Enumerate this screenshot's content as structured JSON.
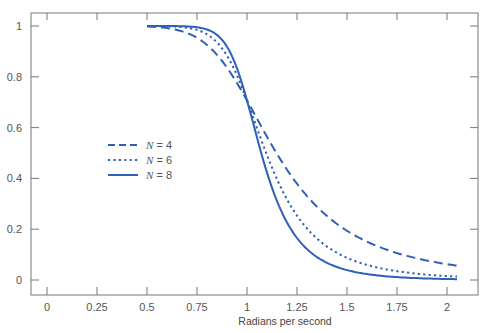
{
  "chart_data": {
    "type": "line",
    "title": "",
    "xlabel": "Radians per second",
    "ylabel": "",
    "xlim": [
      -0.07,
      2.15
    ],
    "ylim": [
      -0.06,
      1.05
    ],
    "xticks": [
      0,
      0.25,
      0.5,
      0.75,
      1,
      1.25,
      1.5,
      1.75,
      2
    ],
    "xtick_labels": [
      "0",
      "0.25",
      "0.5",
      "0.75",
      "1",
      "1.25",
      "1.5",
      "1.75",
      "2"
    ],
    "yticks": [
      0,
      0.2,
      0.4,
      0.6,
      0.8,
      1
    ],
    "ytick_labels": [
      "0",
      "0.2",
      "0.4",
      "0.6",
      "0.8",
      "1"
    ],
    "grid": false,
    "legend_position": "center-left",
    "line_color": "#2f5fb8",
    "series": [
      {
        "name": "N = 4",
        "style": "dashed",
        "order": 4
      },
      {
        "name": "N = 6",
        "style": "dotted",
        "order": 6
      },
      {
        "name": "N = 8",
        "style": "solid",
        "order": 8
      }
    ],
    "x_range_plotted": [
      0.5,
      2.05
    ]
  },
  "legend": {
    "items": [
      {
        "label_var": "N",
        "label_rest": " = 4",
        "style": "dashed"
      },
      {
        "label_var": "N",
        "label_rest": " = 6",
        "style": "dotted"
      },
      {
        "label_var": "N",
        "label_rest": " = 8",
        "style": "solid"
      }
    ]
  }
}
